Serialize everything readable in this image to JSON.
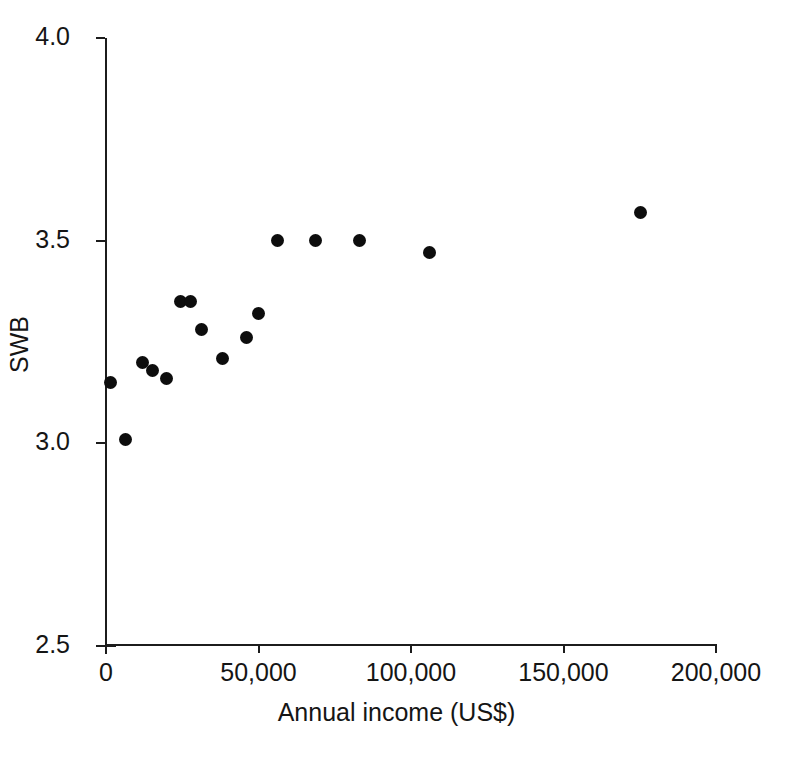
{
  "chart_data": {
    "type": "scatter",
    "title": "",
    "xlabel": "Annual income (US$)",
    "ylabel": "SWB",
    "xlim": [
      0,
      200000
    ],
    "ylim": [
      2.5,
      4.0
    ],
    "xticks": [
      0,
      50000,
      100000,
      150000,
      200000
    ],
    "xticklabels": [
      "0",
      "50,000",
      "100,000",
      "150,000",
      "200,000"
    ],
    "yticks": [
      2.5,
      3.0,
      3.5,
      4.0
    ],
    "yticklabels": [
      "2.5",
      "3.0",
      "3.5",
      "4.0"
    ],
    "grid": false,
    "legend": null,
    "marker": {
      "shape": "circle",
      "color": "#0d0d0d",
      "size": 13
    },
    "points": [
      {
        "x": 1700,
        "y": 3.15
      },
      {
        "x": 6700,
        "y": 3.01
      },
      {
        "x": 12200,
        "y": 3.2
      },
      {
        "x": 15500,
        "y": 3.18
      },
      {
        "x": 20100,
        "y": 3.16
      },
      {
        "x": 24600,
        "y": 3.35
      },
      {
        "x": 28100,
        "y": 3.35
      },
      {
        "x": 31700,
        "y": 3.28
      },
      {
        "x": 38600,
        "y": 3.21
      },
      {
        "x": 46500,
        "y": 3.26
      },
      {
        "x": 50300,
        "y": 3.32
      },
      {
        "x": 56600,
        "y": 3.5
      },
      {
        "x": 68900,
        "y": 3.5
      },
      {
        "x": 83600,
        "y": 3.5
      },
      {
        "x": 106500,
        "y": 3.47
      },
      {
        "x": 175700,
        "y": 3.57
      }
    ]
  },
  "axes": {
    "x_title": "Annual income (US$)",
    "y_title": "SWB",
    "x_tick_labels": [
      "0",
      "50,000",
      "100,000",
      "150,000",
      "200,000"
    ],
    "y_tick_labels": [
      "4.0",
      "3.5",
      "3.0",
      "2.5"
    ],
    "axis_color": "#1c1c1c"
  }
}
